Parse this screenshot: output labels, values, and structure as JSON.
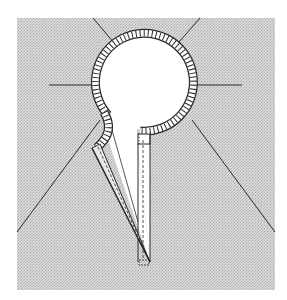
{
  "figure": {
    "colors": {
      "background": "#ffffff",
      "fabric": "#d4d4d4",
      "fabric_dot": "#b4b4b4",
      "line": "#2a2a2a",
      "binding_fill": "#ffffff"
    }
  }
}
